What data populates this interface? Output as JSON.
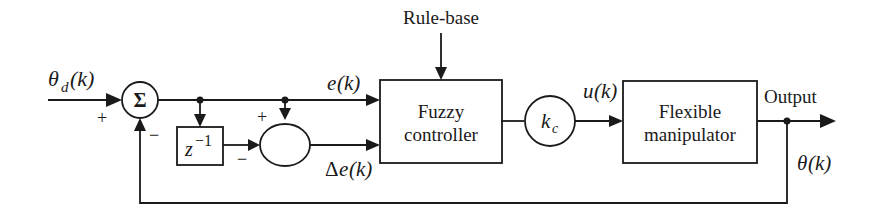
{
  "diagram": {
    "type": "block-diagram",
    "inputs": {
      "reference": {
        "symbol": "θ",
        "subscript": "d",
        "arg": "(k)"
      }
    },
    "summing_junction": {
      "label": "Σ",
      "plus_sign": "+",
      "minus_sign": "−"
    },
    "delay_block": {
      "base": "z",
      "exponent": "−1"
    },
    "difference_junction": {
      "plus_sign": "+",
      "minus_sign": "−"
    },
    "signals": {
      "error": {
        "symbol": "e",
        "arg": "(k)"
      },
      "delta_error": {
        "prefix": "Δ",
        "symbol": "e",
        "arg": "(k)"
      },
      "control": {
        "symbol": "u",
        "arg": "(k)"
      },
      "output_angle": {
        "symbol": "θ",
        "arg": "(k)"
      }
    },
    "rule_base": {
      "label": "Rule-base"
    },
    "fuzzy_controller": {
      "line1": "Fuzzy",
      "line2": "controller"
    },
    "gain": {
      "symbol": "k",
      "subscript": "c"
    },
    "plant": {
      "line1": "Flexible",
      "line2": "manipulator"
    },
    "output": {
      "label": "Output"
    }
  }
}
